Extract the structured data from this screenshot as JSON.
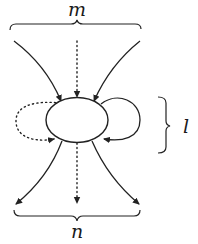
{
  "diagram": {
    "type": "vertex with external and self-loop edges",
    "labels": {
      "top_brace": "m",
      "bottom_brace": "n",
      "right_brace": "l"
    },
    "node": {
      "shape": "ellipse",
      "fill": "#ffffff",
      "stroke": "#222222"
    },
    "edges": {
      "incoming": [
        {
          "id": "in-left",
          "style": "solid"
        },
        {
          "id": "in-middle",
          "style": "dotted"
        },
        {
          "id": "in-right",
          "style": "solid"
        }
      ],
      "outgoing": [
        {
          "id": "out-left",
          "style": "solid"
        },
        {
          "id": "out-middle",
          "style": "dotted"
        },
        {
          "id": "out-right",
          "style": "solid"
        }
      ],
      "loops": [
        {
          "id": "loop-left",
          "style": "dotted"
        },
        {
          "id": "loop-right",
          "style": "solid"
        }
      ]
    }
  }
}
